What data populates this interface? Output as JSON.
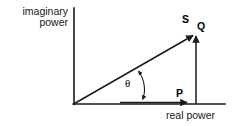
{
  "figure": {
    "background_color": "#ffffff",
    "stroke_color": "#1a1a1a",
    "width": 232,
    "height": 126
  },
  "axes": {
    "y_axis": {
      "label_line1": "imaginary",
      "label_line2": "power",
      "label_full": "imaginary power",
      "x": 74,
      "y_top": 8,
      "y_bottom": 105
    },
    "x_axis": {
      "label": "real power",
      "y": 104,
      "x_left": 74,
      "x_right": 225
    }
  },
  "vectors": [
    {
      "name": "apparent-power",
      "label": "S",
      "description": "apparent power hypotenuse vector",
      "from": [
        74,
        104
      ],
      "to": [
        195,
        34
      ]
    },
    {
      "name": "reactive-power",
      "label": "Q",
      "description": "reactive power vertical vector",
      "from": [
        196,
        104
      ],
      "to": [
        196,
        32
      ]
    },
    {
      "name": "real-power",
      "label": "P",
      "description": "real power horizontal vector",
      "from": [
        74,
        103
      ],
      "to": [
        191,
        103
      ]
    }
  ],
  "angle": {
    "name": "phase-angle",
    "label": "θ",
    "description": "phase angle between S and the real power axis",
    "arc_start": [
      137,
      68
    ],
    "arc_end": [
      142,
      102
    ]
  }
}
